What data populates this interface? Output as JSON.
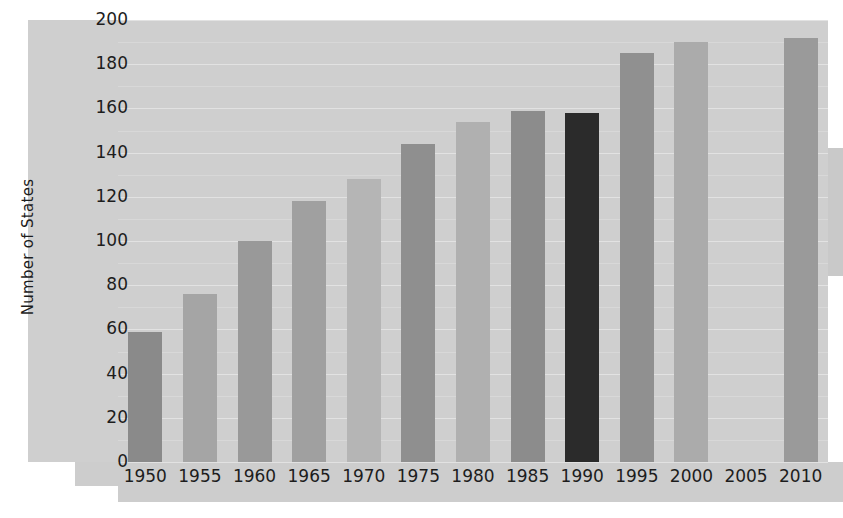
{
  "chart_data": {
    "type": "bar",
    "title": "",
    "xlabel": "",
    "ylabel": "Number of States",
    "ylim": [
      0,
      200
    ],
    "ytick_values": [
      0,
      20,
      40,
      60,
      80,
      100,
      120,
      140,
      160,
      180,
      200
    ],
    "ytick_labels": [
      "0",
      "20",
      "40",
      "60",
      "80",
      "100",
      "120",
      "140",
      "160",
      "180",
      "200"
    ],
    "grid": true,
    "grid_minor": true,
    "legend": "none",
    "categories": [
      "1950",
      "1955",
      "1960",
      "1965",
      "1970",
      "1975",
      "1980",
      "1985",
      "1990",
      "1995",
      "2000",
      "2005",
      "2010"
    ],
    "values": [
      59,
      76,
      100,
      118,
      128,
      144,
      154,
      159,
      158,
      185,
      190,
      null,
      192
    ],
    "bar_colors": [
      "#8a8a8a",
      "#a5a5a5",
      "#999999",
      "#a0a0a0",
      "#b5b5b5",
      "#8f8f8f",
      "#b0b0b0",
      "#8c8c8c",
      "#2b2b2b",
      "#909090",
      "#ababab",
      "#cfcfcf",
      "#9a9a9a"
    ]
  },
  "style": {
    "panel_background": "#cfcfcf",
    "page_background": "#ffffff",
    "gridline_color": "#e2e2e2",
    "gridline_minor_color": "#d8d8d8",
    "text_color": "#1d1d1d"
  }
}
